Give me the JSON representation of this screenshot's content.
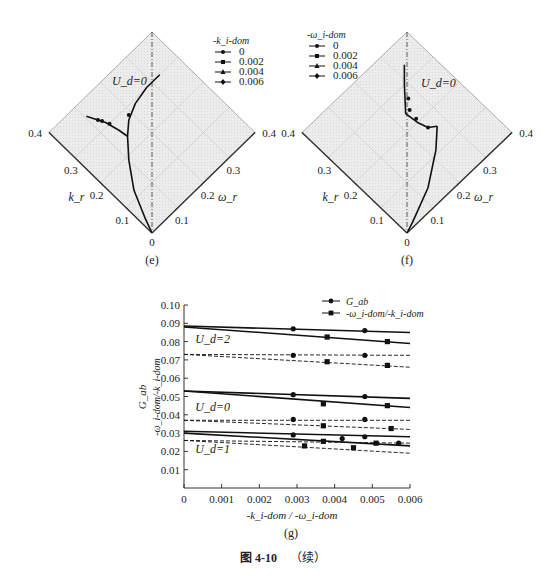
{
  "chart_data": [
    {
      "id": "e",
      "type": "line",
      "subtype": "diamond-ternary",
      "caption": "(e)",
      "annotation": "U_d=0",
      "left_axis": {
        "label": "k_r",
        "ticks": [
          "0.1",
          "0.2",
          "0.3",
          "0.4"
        ],
        "range": [
          0,
          0.4
        ]
      },
      "right_axis": {
        "label": "ω_r",
        "ticks": [
          "0.1",
          "0.2",
          "0.3",
          "0.4"
        ],
        "range": [
          0,
          0.4
        ]
      },
      "origin_label": "0",
      "grid": true,
      "legend": {
        "title": "-k_i-dom",
        "placement": "top-right",
        "entries": [
          {
            "label": "0",
            "marker": "circle"
          },
          {
            "label": "0.002",
            "marker": "square"
          },
          {
            "label": "0.004",
            "marker": "triangle"
          },
          {
            "label": "0.006",
            "marker": "diamond"
          }
        ]
      },
      "curves": [
        {
          "name": "branch-main",
          "points": [
            [
              0.0,
              0.0
            ],
            [
              0.04,
              0.015
            ],
            [
              0.12,
              0.05
            ],
            [
              0.19,
              0.1
            ],
            [
              0.24,
              0.145
            ],
            [
              0.27,
              0.18
            ],
            [
              0.29,
              0.225
            ],
            [
              0.3,
              0.28
            ],
            [
              0.3,
              0.33
            ]
          ]
        },
        {
          "name": "branch-upper-left",
          "points": [
            [
              0.24,
              0.145
            ],
            [
              0.27,
              0.14
            ],
            [
              0.31,
              0.13
            ],
            [
              0.33,
              0.12
            ],
            [
              0.36,
              0.105
            ]
          ]
        }
      ],
      "markers": [
        [
          0.33,
          0.12
        ],
        [
          0.32,
          0.126
        ],
        [
          0.3,
          0.135
        ],
        [
          0.28,
          0.19
        ]
      ],
      "centerline": "dash-dot vertical"
    },
    {
      "id": "f",
      "type": "line",
      "subtype": "diamond-ternary",
      "caption": "(f)",
      "annotation": "U_d=0",
      "left_axis": {
        "label": "k_r",
        "ticks": [
          "0.1",
          "0.2",
          "0.3",
          "0.4"
        ],
        "range": [
          0,
          0.4
        ]
      },
      "right_axis": {
        "label": "ω_r",
        "ticks": [
          "0.1",
          "0.2",
          "0.3",
          "0.4"
        ],
        "range": [
          0,
          0.4
        ]
      },
      "origin_label": "0",
      "grid": true,
      "legend": {
        "title": "-ω_i-dom",
        "placement": "top-left",
        "entries": [
          {
            "label": "0",
            "marker": "circle"
          },
          {
            "label": "0.002",
            "marker": "square"
          },
          {
            "label": "0.004",
            "marker": "triangle"
          },
          {
            "label": "0.006",
            "marker": "diamond"
          }
        ]
      },
      "curves": [
        {
          "name": "branch-main",
          "points": [
            [
              0.0,
              0.0
            ],
            [
              0.01,
              0.03
            ],
            [
              0.05,
              0.13
            ],
            [
              0.11,
              0.22
            ],
            [
              0.155,
              0.27
            ]
          ]
        },
        {
          "name": "branch-upper",
          "points": [
            [
              0.155,
              0.27
            ],
            [
              0.17,
              0.25
            ],
            [
              0.2,
              0.24
            ],
            [
              0.24,
              0.235
            ],
            [
              0.3,
              0.29
            ],
            [
              0.34,
              0.33
            ]
          ]
        }
      ],
      "markers": [
        [
          0.17,
          0.25
        ],
        [
          0.21,
          0.245
        ],
        [
          0.24,
          0.25
        ],
        [
          0.265,
          0.27
        ]
      ],
      "centerline": "dash-dot vertical"
    },
    {
      "id": "g",
      "type": "line",
      "caption": "(g)",
      "xlabel": "-k_i-dom / -ω_i-dom",
      "ylabel_top": "G_ab",
      "ylabel_bottom": "-ω_i-dom/-k_i-dom",
      "xlim": [
        0,
        0.006
      ],
      "ylim": [
        0,
        0.1
      ],
      "x_ticks": [
        "0",
        "0.001",
        "0.002",
        "0.003",
        "0.004",
        "0.005",
        "0.006"
      ],
      "y_ticks": [
        "0.01",
        "0.02",
        "0.03",
        "0.04",
        "0.05",
        "0.06",
        "0.07",
        "0.08",
        "0.09",
        "0.10"
      ],
      "grid": false,
      "legend": {
        "placement": "top-right",
        "entries": [
          {
            "label": "G_ab",
            "marker": "circle"
          },
          {
            "label": "-ω_i-dom/-k_i-dom",
            "marker": "square"
          }
        ]
      },
      "annotations": [
        {
          "text": "U_d=2",
          "x": 0.0003,
          "y": 0.079
        },
        {
          "text": "U_d=0",
          "x": 0.0003,
          "y": 0.042
        },
        {
          "text": "U_d=1",
          "x": 0.0003,
          "y": 0.019
        }
      ],
      "series": [
        {
          "name": "U2 G_ab solid",
          "style": "solid",
          "marker": "circle",
          "line": [
            [
              0,
              0.0885
            ],
            [
              0.006,
              0.085
            ]
          ],
          "points": [
            [
              0.0029,
              0.087
            ],
            [
              0.0048,
              0.086
            ]
          ]
        },
        {
          "name": "U2 ratio solid",
          "style": "solid",
          "marker": "square",
          "line": [
            [
              0,
              0.088
            ],
            [
              0.006,
              0.079
            ]
          ],
          "points": [
            [
              0.0038,
              0.0825
            ],
            [
              0.0054,
              0.08
            ]
          ]
        },
        {
          "name": "U2 G_ab dashed",
          "style": "dashed",
          "marker": "circle",
          "line": [
            [
              0,
              0.073
            ],
            [
              0.006,
              0.0725
            ]
          ],
          "points": [
            [
              0.0029,
              0.0725
            ],
            [
              0.0048,
              0.0725
            ]
          ]
        },
        {
          "name": "U2 ratio dashed",
          "style": "dashed",
          "marker": "square",
          "line": [
            [
              0,
              0.073
            ],
            [
              0.006,
              0.066
            ]
          ],
          "points": [
            [
              0.0038,
              0.069
            ],
            [
              0.0054,
              0.067
            ]
          ]
        },
        {
          "name": "U0 G_ab solid",
          "style": "solid",
          "marker": "circle",
          "line": [
            [
              0,
              0.053
            ],
            [
              0.006,
              0.049
            ]
          ],
          "points": [
            [
              0.0029,
              0.051
            ],
            [
              0.0048,
              0.05
            ]
          ]
        },
        {
          "name": "U0 ratio solid",
          "style": "solid",
          "marker": "square",
          "line": [
            [
              0,
              0.053
            ],
            [
              0.006,
              0.044
            ]
          ],
          "points": [
            [
              0.0037,
              0.046
            ],
            [
              0.0054,
              0.045
            ]
          ]
        },
        {
          "name": "U0 G_ab dashed",
          "style": "dashed",
          "marker": "circle",
          "line": [
            [
              0,
              0.037
            ],
            [
              0.006,
              0.037
            ]
          ],
          "points": [
            [
              0.0029,
              0.0375
            ],
            [
              0.0048,
              0.0375
            ]
          ]
        },
        {
          "name": "U0 ratio dashed",
          "style": "dashed",
          "marker": "square",
          "line": [
            [
              0,
              0.037
            ],
            [
              0.006,
              0.032
            ]
          ],
          "points": [
            [
              0.0037,
              0.034
            ],
            [
              0.0055,
              0.0325
            ]
          ]
        },
        {
          "name": "U1 G_ab solid",
          "style": "solid",
          "marker": "circle",
          "line": [
            [
              0,
              0.031
            ],
            [
              0.006,
              0.028
            ]
          ],
          "points": [
            [
              0.0029,
              0.029
            ],
            [
              0.0048,
              0.028
            ]
          ]
        },
        {
          "name": "U1 ratio solid",
          "style": "solid",
          "marker": "square",
          "line": [
            [
              0,
              0.03
            ],
            [
              0.006,
              0.023
            ]
          ],
          "points": [
            [
              0.0037,
              0.0255
            ],
            [
              0.0051,
              0.0245
            ]
          ]
        },
        {
          "name": "U1 G_ab dashed",
          "style": "dashed",
          "marker": "circle",
          "line": [
            [
              0,
              0.026
            ],
            [
              0.006,
              0.0245
            ]
          ],
          "points": [
            [
              0.0042,
              0.027
            ],
            [
              0.0057,
              0.0245
            ]
          ]
        },
        {
          "name": "U1 ratio dashed",
          "style": "dashed",
          "marker": "square",
          "line": [
            [
              0,
              0.026
            ],
            [
              0.006,
              0.019
            ]
          ],
          "points": [
            [
              0.0032,
              0.023
            ],
            [
              0.0045,
              0.022
            ]
          ]
        }
      ]
    }
  ],
  "figure_caption": {
    "number": "图 4-10",
    "suffix": "（续）"
  }
}
